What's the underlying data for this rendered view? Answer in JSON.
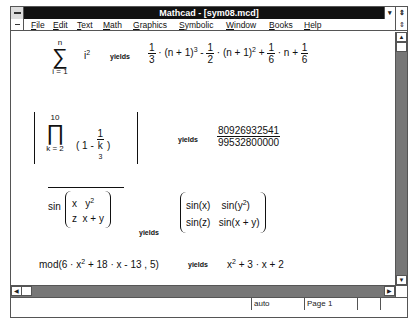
{
  "window": {
    "title": "Mathcad - [sym08.mcd]",
    "min_glyph": "▾",
    "restore_glyph": "⇕"
  },
  "menu": {
    "items": [
      {
        "u": "F",
        "rest": "ile"
      },
      {
        "u": "E",
        "rest": "dit"
      },
      {
        "u": "T",
        "rest": "ext"
      },
      {
        "u": "M",
        "rest": "ath"
      },
      {
        "u": "G",
        "rest": "raphics"
      },
      {
        "u": "S",
        "rest": "ymbolic"
      },
      {
        "u": "W",
        "rest": "indow"
      },
      {
        "u": "B",
        "rest": "ooks"
      },
      {
        "u": "H",
        "rest": "elp"
      }
    ]
  },
  "equations": {
    "yields": "yields",
    "sum": {
      "upper": "n",
      "symbol": "∑",
      "lower": "i = 1",
      "term": "i",
      "term_exp": "2",
      "result": {
        "f1_num": "1",
        "f1_den": "3",
        "p1": "(n + 1)",
        "e1": "3",
        "op1": "-",
        "f2_num": "1",
        "f2_den": "2",
        "p2": "(n + 1)",
        "e2": "2",
        "op2": "+",
        "f3_num": "1",
        "f3_den": "6",
        "var": "n",
        "op3": "+",
        "f4_num": "1",
        "f4_den": "6"
      }
    },
    "product": {
      "upper": "10",
      "symbol": "∏",
      "lower": "k = 2",
      "term_lead": "1 -",
      "frac_num": "1",
      "frac_den": "k",
      "frac_den_exp": "3",
      "result_num": "80926932541",
      "result_den": "99532800000"
    },
    "vectorize": {
      "func": "sin",
      "m11": "x",
      "m12": "y",
      "m12_exp": "2",
      "m21": "z",
      "m22": "x + y",
      "r11": "sin(x)",
      "r12a": "sin(y",
      "r12_exp": "2",
      "r12b": ")",
      "r21": "sin(z)",
      "r22": "sin(x + y)"
    },
    "mod": {
      "lhs_a": "mod(6 · x",
      "lhs_exp": "2",
      "lhs_b": " + 18 · x - 13 , 5)",
      "rhs_a": "x",
      "rhs_exp": "2",
      "rhs_b": " + 3 · x + 2"
    }
  },
  "scrollbars": {
    "up": "▲",
    "down": "▼",
    "left": "◀",
    "right": "▶"
  },
  "status": {
    "mode": "auto",
    "page": "Page 1"
  }
}
